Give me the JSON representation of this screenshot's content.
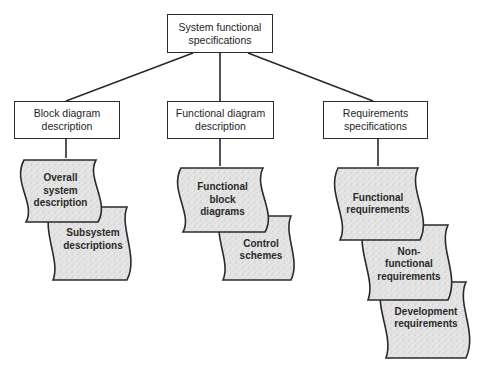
{
  "diagram": {
    "root": {
      "label_line1": "System functional",
      "label_line2": "specifications"
    },
    "branches": [
      {
        "label_line1": "Block diagram",
        "label_line2": "description",
        "documents": [
          {
            "lines": [
              "Overall",
              "system",
              "description"
            ]
          },
          {
            "lines": [
              "Subsystem",
              "descriptions"
            ]
          }
        ]
      },
      {
        "label_line1": "Functional diagram",
        "label_line2": "description",
        "documents": [
          {
            "lines": [
              "Functional",
              "block",
              "diagrams"
            ]
          },
          {
            "lines": [
              "Control",
              "schemes"
            ]
          }
        ]
      },
      {
        "label_line1": "Requirements",
        "label_line2": "specifications",
        "documents": [
          {
            "lines": [
              "Functional",
              "requirements"
            ]
          },
          {
            "lines": [
              "Non-",
              "functional",
              "requirements"
            ]
          },
          {
            "lines": [
              "Development",
              "requirements"
            ]
          }
        ]
      }
    ]
  },
  "colors": {
    "line": "#2a2a2a",
    "document_fill": "#e2e2e2",
    "background": "#ffffff"
  }
}
